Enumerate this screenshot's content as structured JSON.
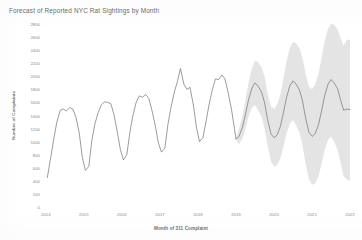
{
  "chart_data": {
    "type": "line",
    "title": "Forecast of Reported NYC Rat Sightings by Month",
    "xlabel": "Month of 311 Complaint",
    "ylabel": "Number of Complaints",
    "ylim": [
      0,
      2800
    ],
    "xlim": [
      2013.9,
      2022.05
    ],
    "grid": false,
    "legend_position": "none",
    "yticks": [
      0,
      200,
      400,
      600,
      800,
      1000,
      1200,
      1400,
      1600,
      1800,
      2000,
      2200,
      2400,
      2600,
      2800
    ],
    "ytick_labels": [
      "0",
      "200",
      "400",
      "600",
      "800",
      "1000",
      "1200",
      "1400",
      "1600",
      "1800",
      "2000",
      "2200",
      "2400",
      "2600",
      "2800"
    ],
    "xticks": [
      2014,
      2015,
      2016,
      2017,
      2018,
      2019,
      2020,
      2021,
      2022
    ],
    "xtick_labels": [
      "2014",
      "2015",
      "2016",
      "2017",
      "2018",
      "2019",
      "2020",
      "2021",
      "2022"
    ],
    "colors": {
      "line": "#7b7b7b",
      "band": "#e4e4e4",
      "text": "#8a8a8a",
      "title": "#6b6b6b",
      "background": "#ffffff"
    },
    "forecast_start_x": 2019.0,
    "series": [
      {
        "name": "Reported rat sightings",
        "kind": "actual",
        "x": [
          2014.04,
          2014.13,
          2014.21,
          2014.29,
          2014.38,
          2014.46,
          2014.54,
          2014.63,
          2014.71,
          2014.79,
          2014.88,
          2014.96,
          2015.04,
          2015.13,
          2015.21,
          2015.29,
          2015.38,
          2015.46,
          2015.54,
          2015.63,
          2015.71,
          2015.79,
          2015.88,
          2015.96,
          2016.04,
          2016.13,
          2016.21,
          2016.29,
          2016.38,
          2016.46,
          2016.54,
          2016.63,
          2016.71,
          2016.79,
          2016.88,
          2016.96,
          2017.04,
          2017.13,
          2017.21,
          2017.29,
          2017.38,
          2017.46,
          2017.54,
          2017.63,
          2017.71,
          2017.79,
          2017.88,
          2017.96,
          2018.04,
          2018.13,
          2018.21,
          2018.29,
          2018.38,
          2018.46,
          2018.54,
          2018.63,
          2018.71,
          2018.79,
          2018.88,
          2018.96,
          2019.0
        ],
        "values": [
          450,
          760,
          1040,
          1300,
          1480,
          1500,
          1470,
          1520,
          1500,
          1380,
          1130,
          760,
          560,
          620,
          1020,
          1270,
          1450,
          1560,
          1610,
          1600,
          1580,
          1420,
          1150,
          880,
          720,
          800,
          1140,
          1400,
          1610,
          1700,
          1680,
          1720,
          1660,
          1480,
          1240,
          980,
          840,
          900,
          1260,
          1520,
          1760,
          1920,
          2120,
          1880,
          1800,
          1830,
          1560,
          1220,
          1000,
          1060,
          1300,
          1560,
          1800,
          1960,
          1950,
          2020,
          1960,
          1760,
          1500,
          1200,
          1040
        ]
      },
      {
        "name": "Forecast",
        "kind": "forecast",
        "x": [
          2019.0,
          2019.08,
          2019.17,
          2019.25,
          2019.33,
          2019.42,
          2019.5,
          2019.58,
          2019.67,
          2019.75,
          2019.83,
          2019.92,
          2020.0,
          2020.08,
          2020.17,
          2020.25,
          2020.33,
          2020.42,
          2020.5,
          2020.58,
          2020.67,
          2020.75,
          2020.83,
          2020.92,
          2021.0,
          2021.08,
          2021.17,
          2021.25,
          2021.33,
          2021.42,
          2021.5,
          2021.58,
          2021.67,
          2021.75,
          2021.83,
          2021.92,
          2022.0
        ],
        "values": [
          1040,
          1080,
          1220,
          1420,
          1640,
          1820,
          1900,
          1850,
          1760,
          1600,
          1340,
          1120,
          1060,
          1100,
          1240,
          1450,
          1680,
          1860,
          1930,
          1880,
          1790,
          1620,
          1360,
          1140,
          1080,
          1120,
          1260,
          1470,
          1700,
          1880,
          1950,
          1900,
          1810,
          1640,
          1480,
          1500,
          1490
        ],
        "lower": [
          1040,
          960,
          1050,
          1200,
          1380,
          1520,
          1560,
          1480,
          1380,
          1200,
          940,
          700,
          620,
          640,
          750,
          930,
          1130,
          1280,
          1330,
          1250,
          1140,
          940,
          660,
          420,
          340,
          360,
          470,
          660,
          870,
          1030,
          1080,
          1000,
          880,
          680,
          470,
          420,
          400
        ],
        "upper": [
          1040,
          1200,
          1390,
          1640,
          1900,
          2120,
          2240,
          2220,
          2140,
          2000,
          1740,
          1540,
          1500,
          1560,
          1730,
          1970,
          2230,
          2440,
          2530,
          2500,
          2430,
          2280,
          2040,
          1840,
          1800,
          1870,
          2040,
          2280,
          2530,
          2730,
          2800,
          2790,
          2720,
          2580,
          2470,
          2560,
          2560
        ]
      }
    ]
  }
}
